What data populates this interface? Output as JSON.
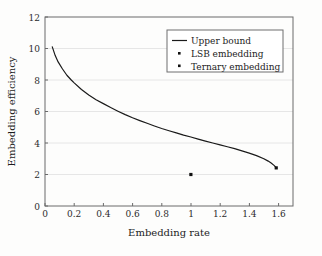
{
  "chart_data": {
    "type": "line",
    "title": "",
    "xlabel": "Embedding rate",
    "ylabel": "Embedding efficiency",
    "xlim": [
      0,
      1.7
    ],
    "ylim": [
      0,
      12
    ],
    "grid": true,
    "grid_axis": "y",
    "legend_position": "top-right",
    "x_ticks": [
      "0",
      "0.2",
      "0.4",
      "0.6",
      "0.8",
      "1",
      "1.2",
      "1.4",
      "1.6"
    ],
    "x_tick_values": [
      0,
      0.2,
      0.4,
      0.6,
      0.8,
      1,
      1.2,
      1.4,
      1.6
    ],
    "y_ticks": [
      "0",
      "2",
      "4",
      "6",
      "8",
      "10",
      "12"
    ],
    "y_tick_values": [
      0,
      2,
      4,
      6,
      8,
      10,
      12
    ],
    "series": [
      {
        "name": "Upper bound",
        "type": "line",
        "marker": "none",
        "color": "#1a1a1a",
        "x": [
          0.05,
          0.07,
          0.09,
          0.12,
          0.15,
          0.18,
          0.2,
          0.25,
          0.3,
          0.35,
          0.4,
          0.45,
          0.5,
          0.55,
          0.6,
          0.65,
          0.7,
          0.75,
          0.8,
          0.85,
          0.9,
          0.95,
          1.0,
          1.05,
          1.1,
          1.15,
          1.2,
          1.25,
          1.3,
          1.35,
          1.4,
          1.45,
          1.5,
          1.53,
          1.55,
          1.57,
          1.58,
          1.585
        ],
        "y": [
          10.1,
          9.55,
          9.15,
          8.7,
          8.3,
          8.0,
          7.82,
          7.4,
          7.05,
          6.75,
          6.5,
          6.25,
          6.02,
          5.8,
          5.6,
          5.42,
          5.25,
          5.08,
          4.92,
          4.78,
          4.64,
          4.5,
          4.38,
          4.25,
          4.12,
          4.0,
          3.88,
          3.76,
          3.64,
          3.5,
          3.36,
          3.2,
          3.0,
          2.85,
          2.73,
          2.58,
          2.48,
          2.42
        ]
      },
      {
        "name": "LSB embedding",
        "type": "scatter",
        "marker": "square",
        "color": "#111111",
        "x": [
          1.0
        ],
        "y": [
          2.0
        ]
      },
      {
        "name": "Ternary embedding",
        "type": "scatter",
        "marker": "square",
        "color": "#111111",
        "x": [
          1.585
        ],
        "y": [
          2.42
        ]
      }
    ],
    "legend_entries": [
      {
        "label": "Upper bound",
        "marker": "line"
      },
      {
        "label": "LSB embedding",
        "marker": "dot"
      },
      {
        "label": "Ternary embedding",
        "marker": "dot"
      }
    ]
  }
}
